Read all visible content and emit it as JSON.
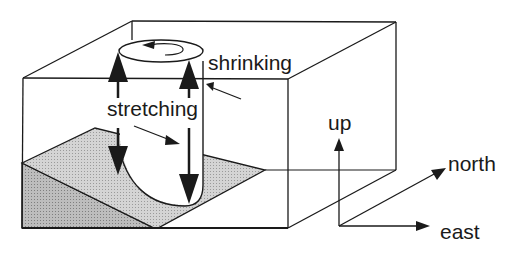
{
  "figure": {
    "labels": {
      "shrinking": "shrinking",
      "stretching": "stretching",
      "up": "up",
      "north": "north",
      "east": "east"
    },
    "axes": [
      "up",
      "north",
      "east"
    ],
    "colors": {
      "line": "#1a1a1a",
      "slope_top": "#cfcfcf",
      "slope_side": "#b8b8b8",
      "background": "#ffffff"
    }
  }
}
